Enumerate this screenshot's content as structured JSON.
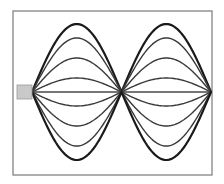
{
  "diagram": {
    "title": "Standing wave on a string (two loops, multiple snapshots)",
    "frame": {
      "x": 13,
      "y": 11,
      "width": 199,
      "height": 164
    },
    "source": {
      "label": "vibrator",
      "x": 17,
      "y": 85,
      "width": 15,
      "height": 14,
      "color": "#c9c9c9"
    },
    "nodes_x": [
      32,
      121.5,
      211
    ],
    "axis_y": 92,
    "loops": 2,
    "snapshots": [
      {
        "amplitude": 68,
        "style": "thick"
      },
      {
        "amplitude": 54,
        "style": "mid"
      },
      {
        "amplitude": 34,
        "style": "mid"
      },
      {
        "amplitude": 14,
        "style": "mid"
      },
      {
        "amplitude": 0,
        "style": "center"
      },
      {
        "amplitude": -14,
        "style": "mid"
      },
      {
        "amplitude": -34,
        "style": "mid"
      },
      {
        "amplitude": -54,
        "style": "mid"
      },
      {
        "amplitude": -68,
        "style": "thick"
      }
    ],
    "colors": {
      "line": "#1a1a1a",
      "frame": "#7a7a7a",
      "background": "#ffffff"
    }
  }
}
